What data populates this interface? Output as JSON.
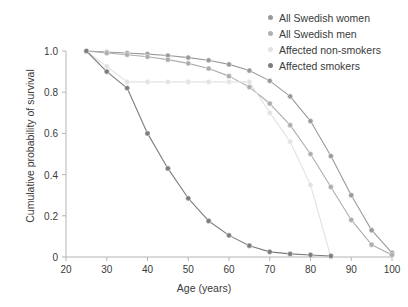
{
  "chart_data": {
    "type": "line",
    "title": "",
    "xlabel": "Age (years)",
    "ylabel": "Cumulative probability of survival",
    "xlim": [
      20,
      100
    ],
    "ylim": [
      0,
      1.0
    ],
    "xticks": [
      20,
      30,
      40,
      50,
      60,
      70,
      80,
      90,
      100
    ],
    "yticks": [
      0,
      0.2,
      0.4,
      0.6,
      0.8,
      1.0
    ],
    "ytick_labels": [
      "0",
      "0.2",
      "0.4",
      "0.6",
      "0.8",
      "1.0"
    ],
    "xtick_labels": [
      "20",
      "30",
      "40",
      "50",
      "60",
      "70",
      "80",
      "90",
      "100"
    ],
    "grid": false,
    "legend_position": "top-right",
    "series": [
      {
        "name": "All Swedish women",
        "color": "#9a9a9a",
        "x": [
          25,
          30,
          35,
          40,
          45,
          50,
          55,
          60,
          65,
          70,
          75,
          80,
          85,
          90,
          95,
          100
        ],
        "values": [
          1.0,
          0.995,
          0.99,
          0.985,
          0.978,
          0.968,
          0.955,
          0.935,
          0.905,
          0.855,
          0.78,
          0.66,
          0.49,
          0.3,
          0.13,
          0.02
        ]
      },
      {
        "name": "All Swedish men",
        "color": "#adadad",
        "x": [
          25,
          30,
          35,
          40,
          45,
          50,
          55,
          60,
          65,
          70,
          75,
          80,
          85,
          90,
          95,
          100
        ],
        "values": [
          1.0,
          0.99,
          0.982,
          0.972,
          0.958,
          0.94,
          0.915,
          0.878,
          0.825,
          0.745,
          0.64,
          0.5,
          0.34,
          0.18,
          0.06,
          0.01
        ]
      },
      {
        "name": "Affected non-smokers",
        "color": "#e2e2e2",
        "x": [
          25,
          30,
          35,
          40,
          45,
          50,
          55,
          60,
          65,
          70,
          75,
          80,
          85
        ],
        "values": [
          1.0,
          0.925,
          0.85,
          0.85,
          0.85,
          0.85,
          0.85,
          0.85,
          0.85,
          0.7,
          0.56,
          0.35,
          0.0
        ]
      },
      {
        "name": "Affected smokers",
        "color": "#7d7d7d",
        "x": [
          25,
          30,
          35,
          40,
          45,
          50,
          55,
          60,
          65,
          70,
          75,
          80,
          85
        ],
        "values": [
          1.0,
          0.9,
          0.82,
          0.6,
          0.43,
          0.285,
          0.175,
          0.105,
          0.055,
          0.025,
          0.015,
          0.01,
          0.005
        ]
      }
    ]
  },
  "legend": {
    "items": [
      {
        "label": "All Swedish women"
      },
      {
        "label": "All Swedish men"
      },
      {
        "label": "Affected non-smokers"
      },
      {
        "label": "Affected smokers"
      }
    ]
  }
}
